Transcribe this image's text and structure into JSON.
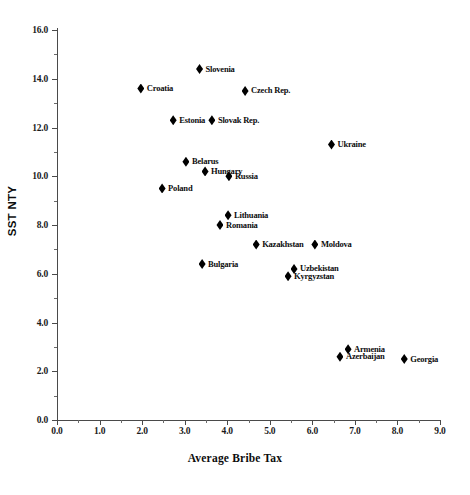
{
  "chart_data": {
    "type": "scatter",
    "title": "",
    "xlabel": "Average Bribe Tax",
    "ylabel": "SST NTY",
    "xlim": [
      0.0,
      9.0
    ],
    "ylim": [
      0.0,
      16.0
    ],
    "xticks": [
      "0.0",
      "1.0",
      "2.0",
      "3.0",
      "4.0",
      "5.0",
      "6.0",
      "7.0",
      "8.0",
      "9.0"
    ],
    "yticks": [
      "0.0",
      "2.0",
      "4.0",
      "6.0",
      "8.0",
      "10.0",
      "12.0",
      "14.0",
      "16.0"
    ],
    "xtick_values": [
      0.0,
      1.0,
      2.0,
      3.0,
      4.0,
      5.0,
      6.0,
      7.0,
      8.0,
      9.0
    ],
    "ytick_values": [
      0.0,
      2.0,
      4.0,
      6.0,
      8.0,
      10.0,
      12.0,
      14.0,
      16.0
    ],
    "x_minor_step": 0.5,
    "y_minor_step": 1.0,
    "grid": false,
    "legend": "none",
    "marker": "diamond",
    "marker_color": "#000000",
    "points": [
      {
        "label": "Slovenia",
        "x": 3.35,
        "y": 14.4,
        "label_side": "right"
      },
      {
        "label": "Croatia",
        "x": 1.97,
        "y": 13.6,
        "label_side": "right"
      },
      {
        "label": "Czech Rep.",
        "x": 4.42,
        "y": 13.5,
        "label_side": "right"
      },
      {
        "label": "Estonia",
        "x": 2.73,
        "y": 12.3,
        "label_side": "right"
      },
      {
        "label": "Slovak Rep.",
        "x": 3.64,
        "y": 12.3,
        "label_side": "right"
      },
      {
        "label": "Ukraine",
        "x": 6.45,
        "y": 11.3,
        "label_side": "right"
      },
      {
        "label": "Belarus",
        "x": 3.03,
        "y": 10.6,
        "label_side": "right"
      },
      {
        "label": "Hungary",
        "x": 3.48,
        "y": 10.2,
        "label_side": "right"
      },
      {
        "label": "Russia",
        "x": 4.04,
        "y": 10.0,
        "label_side": "right"
      },
      {
        "label": "Poland",
        "x": 2.47,
        "y": 9.5,
        "label_side": "right"
      },
      {
        "label": "Lithuania",
        "x": 4.02,
        "y": 8.4,
        "label_side": "right"
      },
      {
        "label": "Romania",
        "x": 3.83,
        "y": 8.0,
        "label_side": "right"
      },
      {
        "label": "Kazakhstan",
        "x": 4.68,
        "y": 7.2,
        "label_side": "right"
      },
      {
        "label": "Moldova",
        "x": 6.06,
        "y": 7.2,
        "label_side": "right"
      },
      {
        "label": "Uzbekistan",
        "x": 5.57,
        "y": 6.2,
        "label_side": "right"
      },
      {
        "label": "Bulgaria",
        "x": 3.41,
        "y": 6.4,
        "label_side": "right"
      },
      {
        "label": "Kyrgyzstan",
        "x": 5.43,
        "y": 5.9,
        "label_side": "right"
      },
      {
        "label": "Armenia",
        "x": 6.84,
        "y": 2.9,
        "label_side": "right"
      },
      {
        "label": "Azerbaijan",
        "x": 6.65,
        "y": 2.6,
        "label_side": "right"
      },
      {
        "label": "Georgia",
        "x": 8.16,
        "y": 2.5,
        "label_side": "right"
      }
    ]
  }
}
